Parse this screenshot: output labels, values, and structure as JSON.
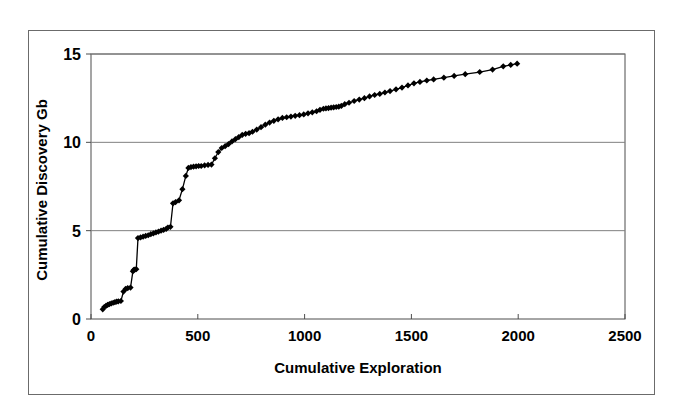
{
  "chart_data": {
    "type": "line",
    "title": "",
    "xlabel": "Cumulative Exploration",
    "ylabel": "Cumulative Discovery Gb",
    "xlim": [
      0,
      2500
    ],
    "ylim": [
      0,
      15
    ],
    "xticks": [
      0,
      500,
      1000,
      1500,
      2000,
      2500
    ],
    "yticks": [
      0,
      5,
      10,
      15
    ],
    "xtick_labels": [
      "0",
      "500",
      "1000",
      "1500",
      "2000",
      "2500"
    ],
    "ytick_labels": [
      "0",
      "5",
      "10",
      "15"
    ],
    "grid": "horizontal",
    "legend": "none",
    "marker": "diamond",
    "marker_color": "#000000",
    "line_color": "#000000",
    "series": [
      {
        "name": "Cumulative Discovery",
        "x": [
          55,
          62,
          70,
          78,
          86,
          95,
          104,
          112,
          120,
          128,
          140,
          152,
          162,
          172,
          185,
          196,
          200,
          205,
          212,
          220,
          232,
          244,
          256,
          268,
          280,
          292,
          304,
          316,
          328,
          340,
          352,
          360,
          372,
          384,
          396,
          412,
          428,
          444,
          456,
          468,
          480,
          492,
          504,
          516,
          532,
          548,
          564,
          580,
          596,
          612,
          628,
          644,
          660,
          676,
          692,
          708,
          724,
          740,
          756,
          776,
          796,
          816,
          836,
          856,
          876,
          896,
          916,
          936,
          956,
          976,
          996,
          1016,
          1036,
          1056,
          1072,
          1088,
          1100,
          1112,
          1124,
          1136,
          1148,
          1160,
          1172,
          1188,
          1208,
          1232,
          1256,
          1280,
          1304,
          1328,
          1352,
          1376,
          1400,
          1428,
          1456,
          1484,
          1512,
          1540,
          1572,
          1604,
          1652,
          1700,
          1752,
          1820,
          1880,
          1930,
          1965,
          1995
        ],
        "y": [
          0.55,
          0.68,
          0.74,
          0.8,
          0.84,
          0.88,
          0.92,
          0.95,
          0.98,
          1.0,
          1.02,
          1.55,
          1.7,
          1.75,
          1.78,
          2.7,
          2.78,
          2.8,
          2.82,
          4.58,
          4.62,
          4.66,
          4.7,
          4.74,
          4.8,
          4.85,
          4.9,
          4.95,
          5.0,
          5.05,
          5.1,
          5.18,
          5.22,
          6.55,
          6.62,
          6.72,
          7.35,
          8.1,
          8.55,
          8.6,
          8.62,
          8.64,
          8.66,
          8.66,
          8.7,
          8.72,
          8.74,
          9.1,
          9.45,
          9.68,
          9.78,
          9.9,
          10.05,
          10.18,
          10.3,
          10.42,
          10.48,
          10.52,
          10.6,
          10.72,
          10.86,
          11.0,
          11.12,
          11.22,
          11.3,
          11.38,
          11.42,
          11.46,
          11.5,
          11.54,
          11.58,
          11.64,
          11.7,
          11.76,
          11.84,
          11.9,
          11.92,
          11.94,
          11.96,
          11.98,
          12.0,
          12.02,
          12.06,
          12.16,
          12.24,
          12.34,
          12.42,
          12.5,
          12.6,
          12.68,
          12.74,
          12.82,
          12.9,
          13.0,
          13.1,
          13.22,
          13.34,
          13.42,
          13.5,
          13.56,
          13.66,
          13.76,
          13.86,
          13.98,
          14.12,
          14.3,
          14.38,
          14.45
        ]
      }
    ]
  },
  "axes": {
    "x_axis_label": "Cumulative Exploration",
    "y_axis_label": "Cumulative Discovery Gb"
  }
}
